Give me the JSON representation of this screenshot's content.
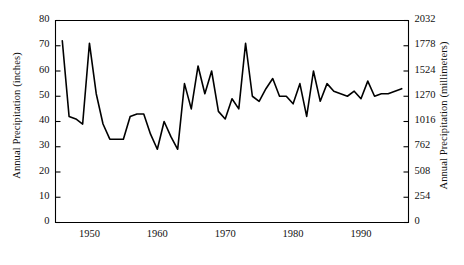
{
  "chart_data": {
    "type": "line",
    "title": "",
    "ylabel": "Annual Precipitation (inches)",
    "ylabel_right": "Annual Precipitation (millimeters)",
    "xlabel": "",
    "xlim": [
      1945,
      1997
    ],
    "ylim": [
      0,
      80
    ],
    "ylim_right": [
      0,
      2032
    ],
    "grid": false,
    "legend": false,
    "line_color": "#000000",
    "yticks": [
      0,
      10,
      20,
      30,
      40,
      50,
      60,
      70,
      80
    ],
    "ytick_labels": [
      "0",
      "10",
      "20",
      "30",
      "40",
      "50",
      "60",
      "70",
      "80"
    ],
    "yticks_right": [
      0,
      254,
      508,
      762,
      1016,
      1270,
      1524,
      1778,
      2032
    ],
    "ytick_labels_right": [
      "0",
      "254",
      "508",
      "762",
      "1016",
      "1270",
      "1524",
      "1778",
      "2032"
    ],
    "xticks": [
      1950,
      1960,
      1970,
      1980,
      1990
    ],
    "xtick_labels": [
      "1950",
      "1960",
      "1970",
      "1980",
      "1990"
    ],
    "x": [
      1946,
      1947,
      1948,
      1949,
      1950,
      1951,
      1952,
      1953,
      1954,
      1955,
      1956,
      1957,
      1958,
      1959,
      1960,
      1961,
      1962,
      1963,
      1964,
      1965,
      1966,
      1967,
      1968,
      1969,
      1970,
      1971,
      1972,
      1973,
      1974,
      1975,
      1976,
      1977,
      1978,
      1979,
      1980,
      1981,
      1982,
      1983,
      1984,
      1985,
      1986,
      1987,
      1988,
      1989,
      1990,
      1991,
      1992,
      1993,
      1994,
      1995,
      1996
    ],
    "values": [
      72,
      42,
      41,
      39,
      71,
      51,
      39,
      33,
      33,
      33,
      42,
      43,
      43,
      35,
      29,
      40,
      34,
      29,
      55,
      45,
      62,
      51,
      60,
      44,
      41,
      49,
      45,
      71,
      50,
      48,
      53,
      57,
      50,
      50,
      47,
      55,
      42,
      60,
      48,
      55,
      52,
      51,
      50,
      52,
      49,
      56,
      50,
      51,
      51,
      52,
      53
    ],
    "series_name": "Annual Precipitation"
  }
}
